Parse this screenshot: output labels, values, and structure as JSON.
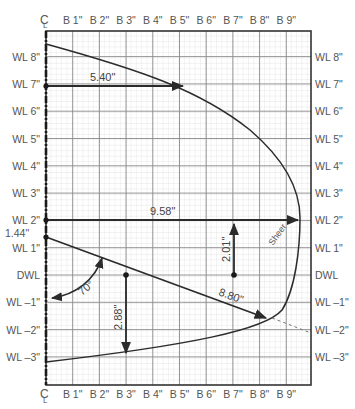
{
  "diagram": {
    "centerline_symbol": "CL",
    "top_axis_labels": [
      "B 1\"",
      "B 2\"",
      "B 3\"",
      "B 4\"",
      "B 5\"",
      "B 6\"",
      "B 7\"",
      "B 8\"",
      "B 9\""
    ],
    "bottom_axis_labels": [
      "B 1\"",
      "B 2\"",
      "B 3\"",
      "B 4\"",
      "B 5\"",
      "B 6\"",
      "B 7\"",
      "B 8\"",
      "B 9\""
    ],
    "left_axis_labels": [
      "WL 8\"",
      "WL 7\"",
      "WL 6\"",
      "WL 5\"",
      "WL 4\"",
      "WL 3\"",
      "WL 2\"",
      "WL 1\"",
      "DWL",
      "WL –1\"",
      "WL –2\"",
      "WL –3\""
    ],
    "right_axis_labels": [
      "WL 8\"",
      "WL 7\"",
      "WL 6\"",
      "WL 5\"",
      "WL 4\"",
      "WL 3\"",
      "WL 2\"",
      "WL 1\"",
      "DWL",
      "WL –1\"",
      "WL –2\"",
      "WL –3\""
    ],
    "extra_left_label": "1.44\"",
    "dimensions": {
      "wl7": "5.40\"",
      "wl2": "9.58\"",
      "vertical_up": "2.01\"",
      "vertical_down": "2.88\"",
      "diagonal": "8.80\"",
      "angle": "70°"
    },
    "curve_label": "Sheer",
    "colors": {
      "major_grid": "#7a7a7a",
      "minor_grid": "#d2d2d2",
      "ink": "#2b2b2b",
      "label": "#555555"
    }
  }
}
